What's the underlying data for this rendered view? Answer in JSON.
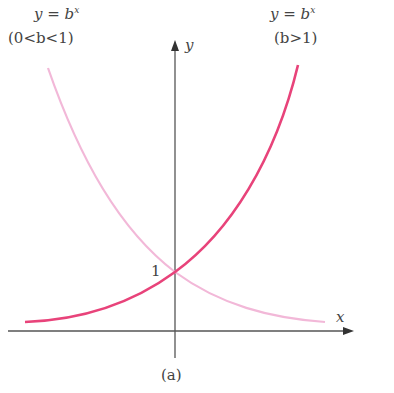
{
  "figure": {
    "caption": "(a)",
    "left_curve": {
      "equation": "y = b^x",
      "eq_lhs": "y = b",
      "eq_sup": "x",
      "condition": "(0<b<1)",
      "color": "#f2b8d8"
    },
    "right_curve": {
      "equation": "y = b^x",
      "eq_lhs": "y = b",
      "eq_sup": "x",
      "condition": "(b>1)",
      "color": "#e8437a"
    },
    "x_axis_label": "x",
    "y_axis_label": "y",
    "intercept_label": "1",
    "axis_color": "#555555"
  }
}
